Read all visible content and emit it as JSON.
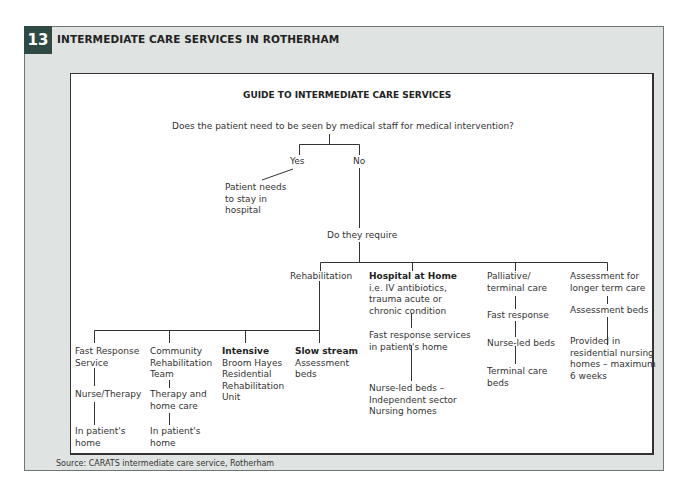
{
  "figure": {
    "number": "13",
    "title": "INTERMEDIATE CARE SERVICES IN ROTHERHAM",
    "source": "Source: CARATS intermediate care service, Rotherham"
  },
  "diagram": {
    "title": "GUIDE TO INTERMEDIATE CARE SERVICES",
    "question": "Does the patient need to be seen by medical staff for medical intervention?",
    "yes": {
      "label": "Yes",
      "outcome": [
        "Patient needs",
        "to stay in",
        "hospital"
      ]
    },
    "no": {
      "label": "No",
      "next": "Do they require",
      "branches": {
        "rehabilitation": {
          "label": "Rehabilitation",
          "options": {
            "fast_response": {
              "title": [
                "Fast Response",
                "Service"
              ],
              "step": "Nurse/Therapy",
              "location": [
                "In patient's",
                "home"
              ]
            },
            "community": {
              "title": [
                "Community",
                "Rehabilitation",
                "Team"
              ],
              "step": [
                "Therapy and",
                "home care"
              ],
              "location": [
                "In patient's",
                "home"
              ]
            },
            "intensive": {
              "heading": "Intensive",
              "detail": [
                "Broom Hayes",
                "Residential",
                "Rehabilitation",
                "Unit"
              ]
            },
            "slow_stream": {
              "heading": "Slow stream",
              "detail": [
                "Assessment",
                "beds"
              ]
            }
          }
        },
        "hospital_at_home": {
          "heading": "Hospital at Home",
          "detail": [
            "i.e. IV antibiotics,",
            "trauma acute or",
            "chronic condition"
          ],
          "step": [
            "Fast response services",
            "in patient's home"
          ],
          "final": [
            "Nurse-led beds –",
            "Independent sector",
            "Nursing homes"
          ]
        },
        "palliative": {
          "label": [
            "Palliative/",
            "terminal care"
          ],
          "step1": "Fast response",
          "step2": "Nurse-led beds",
          "final": [
            "Terminal care",
            "beds"
          ]
        },
        "assessment": {
          "label": [
            "Assessment for",
            "longer term care"
          ],
          "step": "Assessment beds",
          "final": [
            "Provided in",
            "residential nursing",
            "homes – maximum",
            "6 weeks"
          ]
        }
      }
    }
  },
  "colors": {
    "panel_bg": "#dfe3e1",
    "badge_bg": "#2f4a44",
    "line": "#333333"
  }
}
